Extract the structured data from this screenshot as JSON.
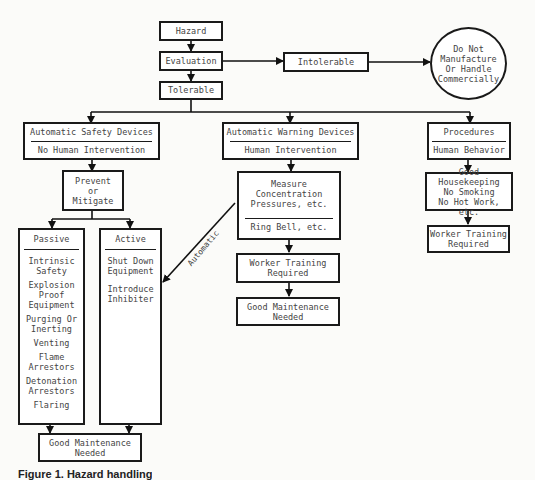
{
  "diagram": {
    "hazard": "Hazard",
    "evaluation": "Evaluation",
    "intolerable": "Intolerable",
    "tolerable": "Tolerable",
    "outcome_circle": [
      "Do Not",
      "Manufacture",
      "Or Handle",
      "Commercially"
    ],
    "automatic_safety": {
      "title": "Automatic Safety Devices",
      "subtitle": "No Human Intervention"
    },
    "prevent": [
      "Prevent",
      "or",
      "Mitigate"
    ],
    "passive": {
      "title": "Passive",
      "items": [
        "Intrinsic Safety",
        "Explosion Proof Equipment",
        "Purging Or Inerting",
        "Venting",
        "Flame Arrestors",
        "Detonation Arrestors",
        "Flaring"
      ]
    },
    "active": {
      "title": "Active",
      "items": [
        "Shut Down Equipment",
        "Introduce Inhibiter"
      ]
    },
    "left_maintenance": [
      "Good Maintenance",
      "Needed"
    ],
    "automatic_warning": {
      "title": "Automatic Warning Devices",
      "subtitle": "Human Intervention"
    },
    "measure": {
      "top": [
        "Measure",
        "Concentration",
        "Pressures, etc."
      ],
      "bottom": "Ring Bell, etc."
    },
    "mid_training": [
      "Worker Training",
      "Required"
    ],
    "mid_maintenance": [
      "Good Maintenance",
      "Needed"
    ],
    "automatic_label": "Automatic",
    "procedures": {
      "title": "Procedures",
      "subtitle": "Human Behavior"
    },
    "housekeeping": [
      "Good Housekeeping",
      "No Smoking",
      "No Hot Work, etc."
    ],
    "right_training": [
      "Worker Training",
      "Required"
    ]
  },
  "caption": "Figure 1. Hazard handling"
}
